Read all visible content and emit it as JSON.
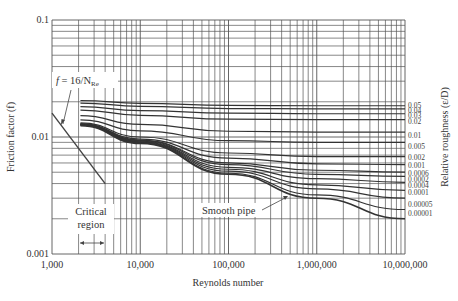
{
  "chart_data": {
    "type": "line",
    "title": "",
    "xlabel": "Reynolds number",
    "ylabel": "Friction factor (f)",
    "right_label": "Relative roughness (ε/D)",
    "xscale": "log",
    "yscale": "log",
    "xlim": [
      1000,
      10000000
    ],
    "ylim": [
      0.001,
      0.1
    ],
    "grid": true,
    "x_ticks": [
      "1,000",
      "10,000",
      "100,000",
      "1,000,000",
      "10,000,000"
    ],
    "y_ticks": [
      "0.001",
      "0.01",
      "0.1"
    ],
    "laminar": {
      "name": "f = 16/N_Re",
      "x": [
        1000,
        4000
      ],
      "y": [
        0.016,
        0.004
      ]
    },
    "series": [
      {
        "name": "0.05",
        "x": [
          2100,
          10000,
          100000,
          1000000,
          10000000
        ],
        "y": [
          0.0205,
          0.0194,
          0.0186,
          0.0185,
          0.0185
        ]
      },
      {
        "name": "0.04",
        "x": [
          2100,
          10000,
          100000,
          1000000,
          10000000
        ],
        "y": [
          0.0195,
          0.0183,
          0.0175,
          0.0174,
          0.0174
        ]
      },
      {
        "name": "0.03",
        "x": [
          2100,
          10000,
          100000,
          1000000,
          10000000
        ],
        "y": [
          0.0182,
          0.0168,
          0.016,
          0.0158,
          0.0158
        ]
      },
      {
        "name": "0.02",
        "x": [
          2100,
          10000,
          100000,
          1000000,
          10000000
        ],
        "y": [
          0.017,
          0.0153,
          0.0142,
          0.0141,
          0.0141
        ]
      },
      {
        "name": "0.01",
        "x": [
          2100,
          10000,
          100000,
          1000000,
          10000000
        ],
        "y": [
          0.0152,
          0.0128,
          0.0112,
          0.011,
          0.011
        ]
      },
      {
        "name": "0.005",
        "x": [
          2100,
          10000,
          100000,
          1000000,
          10000000
        ],
        "y": [
          0.014,
          0.0113,
          0.0093,
          0.009,
          0.009
        ]
      },
      {
        "name": "0.002",
        "x": [
          2100,
          10000,
          100000,
          1000000,
          10000000
        ],
        "y": [
          0.0132,
          0.01,
          0.0073,
          0.0068,
          0.0068
        ]
      },
      {
        "name": "0.001",
        "x": [
          2100,
          10000,
          100000,
          1000000,
          10000000
        ],
        "y": [
          0.013,
          0.0096,
          0.0066,
          0.0059,
          0.0058
        ]
      },
      {
        "name": "0.0006",
        "x": [
          2100,
          10000,
          100000,
          1000000,
          10000000
        ],
        "y": [
          0.0129,
          0.0094,
          0.006,
          0.0052,
          0.005
        ]
      },
      {
        "name": "0.0002",
        "x": [
          2100,
          10000,
          100000,
          1000000,
          10000000
        ],
        "y": [
          0.0128,
          0.0092,
          0.0055,
          0.0044,
          0.0041
        ]
      },
      {
        "name": "0.0004",
        "x": [
          2100,
          10000,
          100000,
          1000000,
          10000000
        ],
        "y": [
          0.0128,
          0.0093,
          0.0058,
          0.0048,
          0.0046
        ]
      },
      {
        "name": "0.0001",
        "x": [
          2100,
          10000,
          100000,
          1000000,
          10000000
        ],
        "y": [
          0.0127,
          0.0091,
          0.0053,
          0.0039,
          0.0035
        ]
      },
      {
        "name": "0.00005",
        "x": [
          2100,
          10000,
          100000,
          1000000,
          10000000
        ],
        "y": [
          0.0127,
          0.009,
          0.0051,
          0.0036,
          0.003
        ]
      },
      {
        "name": "0.00001",
        "x": [
          2100,
          10000,
          100000,
          1000000,
          10000000
        ],
        "y": [
          0.0126,
          0.0089,
          0.0049,
          0.0032,
          0.0024
        ]
      },
      {
        "name": "Smooth pipe",
        "x": [
          2100,
          10000,
          100000,
          1000000,
          10000000
        ],
        "y": [
          0.0125,
          0.0088,
          0.0048,
          0.003,
          0.002
        ]
      }
    ],
    "annotations": [
      "f = 16/N_Re",
      "Critical region",
      "Smooth pipe"
    ]
  },
  "labels": {
    "x_axis": "Reynolds number",
    "y_axis": "Friction factor (f)",
    "right_axis": "Relative roughness (ε/D)",
    "laminar_f": "f",
    "laminar_eq": " = 16/N",
    "laminar_sub": "Re",
    "critical_1": "Critical",
    "critical_2": "region",
    "smooth": "Smooth pipe"
  }
}
